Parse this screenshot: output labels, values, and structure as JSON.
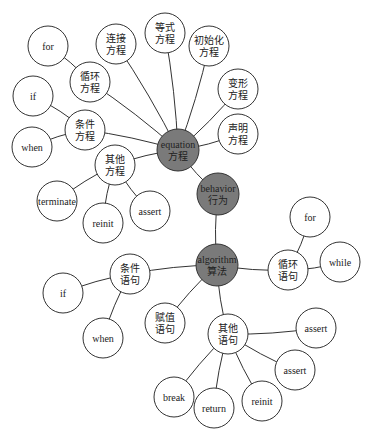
{
  "colors": {
    "hub_fill": "#7a7a7a",
    "leaf_fill": "#ffffff",
    "stroke": "#333333"
  },
  "nodes": [
    {
      "id": "equation",
      "lines": [
        "equation",
        "方程"
      ],
      "x": 178,
      "y": 150,
      "r": 21,
      "hub": true
    },
    {
      "id": "behavior",
      "lines": [
        "behavior",
        "行为"
      ],
      "x": 218,
      "y": 194,
      "r": 21,
      "hub": true
    },
    {
      "id": "algorithm",
      "lines": [
        "algorithm",
        "算法"
      ],
      "x": 217,
      "y": 265,
      "r": 21,
      "hub": true
    },
    {
      "id": "eq_connect",
      "lines": [
        "连接",
        "方程"
      ],
      "x": 116,
      "y": 44,
      "r": 20
    },
    {
      "id": "eq_equality",
      "lines": [
        "等式",
        "方程"
      ],
      "x": 165,
      "y": 33,
      "r": 20
    },
    {
      "id": "eq_init",
      "lines": [
        "初始化",
        "方程"
      ],
      "x": 209,
      "y": 46,
      "r": 20
    },
    {
      "id": "eq_transform",
      "lines": [
        "变形",
        "方程"
      ],
      "x": 238,
      "y": 89,
      "r": 20
    },
    {
      "id": "eq_declare",
      "lines": [
        "声明",
        "方程"
      ],
      "x": 238,
      "y": 134,
      "r": 20
    },
    {
      "id": "eq_loop",
      "lines": [
        "循环",
        "方程"
      ],
      "x": 90,
      "y": 82,
      "r": 20
    },
    {
      "id": "eq_loop_for",
      "lines": [
        "for"
      ],
      "x": 48,
      "y": 46,
      "r": 20
    },
    {
      "id": "eq_cond",
      "lines": [
        "条件",
        "方程"
      ],
      "x": 85,
      "y": 130,
      "r": 20
    },
    {
      "id": "eq_cond_if",
      "lines": [
        "if"
      ],
      "x": 33,
      "y": 96,
      "r": 20
    },
    {
      "id": "eq_cond_when",
      "lines": [
        "when"
      ],
      "x": 32,
      "y": 147,
      "r": 20
    },
    {
      "id": "eq_other",
      "lines": [
        "其他",
        "方程"
      ],
      "x": 115,
      "y": 165,
      "r": 20
    },
    {
      "id": "eq_other_terminate",
      "lines": [
        "terminate"
      ],
      "x": 57,
      "y": 201,
      "r": 20
    },
    {
      "id": "eq_other_reinit",
      "lines": [
        "reinit"
      ],
      "x": 103,
      "y": 223,
      "r": 20
    },
    {
      "id": "eq_other_assert",
      "lines": [
        "assert"
      ],
      "x": 150,
      "y": 211,
      "r": 20
    },
    {
      "id": "al_cond",
      "lines": [
        "条件",
        "语句"
      ],
      "x": 130,
      "y": 274,
      "r": 20
    },
    {
      "id": "al_cond_if",
      "lines": [
        "if"
      ],
      "x": 63,
      "y": 293,
      "r": 20
    },
    {
      "id": "al_cond_when",
      "lines": [
        "when"
      ],
      "x": 103,
      "y": 338,
      "r": 20
    },
    {
      "id": "al_assign",
      "lines": [
        "赋值",
        "语句"
      ],
      "x": 165,
      "y": 323,
      "r": 20
    },
    {
      "id": "al_loop",
      "lines": [
        "循环",
        "语句"
      ],
      "x": 288,
      "y": 270,
      "r": 20
    },
    {
      "id": "al_loop_for",
      "lines": [
        "for"
      ],
      "x": 310,
      "y": 217,
      "r": 20
    },
    {
      "id": "al_loop_while",
      "lines": [
        "while"
      ],
      "x": 340,
      "y": 262,
      "r": 20
    },
    {
      "id": "al_other",
      "lines": [
        "其他",
        "语句"
      ],
      "x": 228,
      "y": 334,
      "r": 20
    },
    {
      "id": "al_other_assert1",
      "lines": [
        "assert"
      ],
      "x": 316,
      "y": 328,
      "r": 20
    },
    {
      "id": "al_other_assert2",
      "lines": [
        "assert"
      ],
      "x": 295,
      "y": 370,
      "r": 20
    },
    {
      "id": "al_other_break",
      "lines": [
        "break"
      ],
      "x": 174,
      "y": 397,
      "r": 20
    },
    {
      "id": "al_other_return",
      "lines": [
        "return"
      ],
      "x": 214,
      "y": 408,
      "r": 20
    },
    {
      "id": "al_other_reinit",
      "lines": [
        "reinit"
      ],
      "x": 262,
      "y": 401,
      "r": 20
    }
  ],
  "edges": [
    [
      "equation",
      "behavior"
    ],
    [
      "behavior",
      "algorithm"
    ],
    [
      "equation",
      "eq_connect"
    ],
    [
      "equation",
      "eq_equality"
    ],
    [
      "equation",
      "eq_init"
    ],
    [
      "equation",
      "eq_transform"
    ],
    [
      "equation",
      "eq_declare"
    ],
    [
      "equation",
      "eq_loop"
    ],
    [
      "equation",
      "eq_cond"
    ],
    [
      "equation",
      "eq_other"
    ],
    [
      "eq_loop",
      "eq_loop_for"
    ],
    [
      "eq_cond",
      "eq_cond_if"
    ],
    [
      "eq_cond",
      "eq_cond_when"
    ],
    [
      "eq_other",
      "eq_other_terminate"
    ],
    [
      "eq_other",
      "eq_other_reinit"
    ],
    [
      "eq_other",
      "eq_other_assert"
    ],
    [
      "algorithm",
      "al_cond"
    ],
    [
      "algorithm",
      "al_assign"
    ],
    [
      "algorithm",
      "al_loop"
    ],
    [
      "algorithm",
      "al_other"
    ],
    [
      "al_cond",
      "al_cond_if"
    ],
    [
      "al_cond",
      "al_cond_when"
    ],
    [
      "al_loop",
      "al_loop_for"
    ],
    [
      "al_loop",
      "al_loop_while"
    ],
    [
      "al_other",
      "al_other_assert1"
    ],
    [
      "al_other",
      "al_other_assert2"
    ],
    [
      "al_other",
      "al_other_break"
    ],
    [
      "al_other",
      "al_other_return"
    ],
    [
      "al_other",
      "al_other_reinit"
    ]
  ]
}
